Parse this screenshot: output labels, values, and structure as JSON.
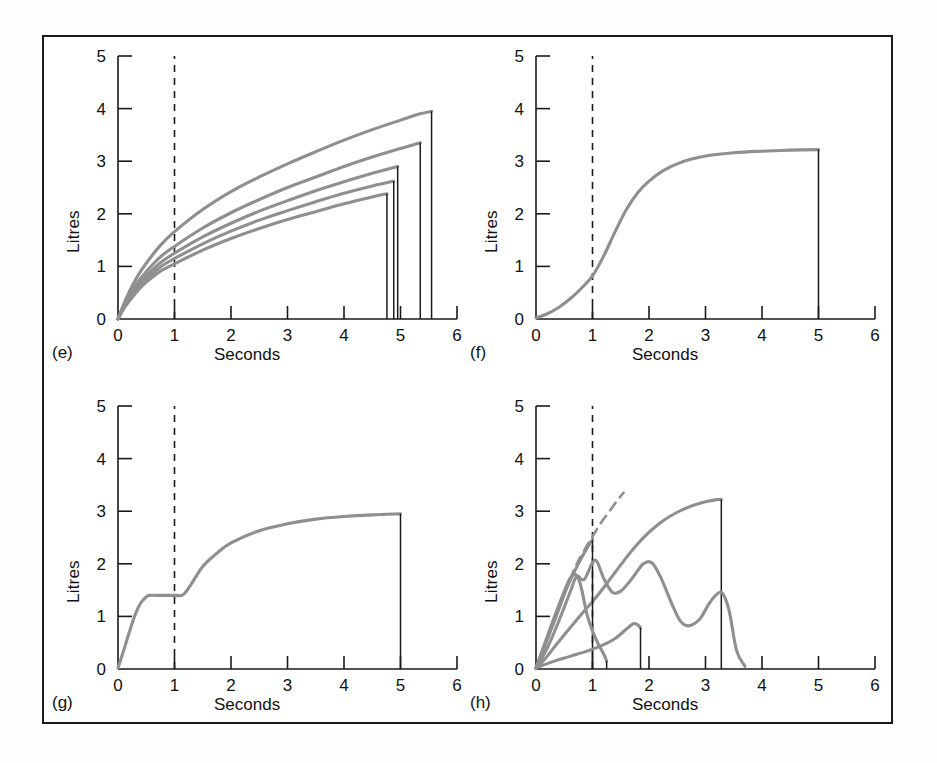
{
  "figure": {
    "background": "#ffffff",
    "border_color": "#1a1a1a",
    "curve_color": "#8f8f8f",
    "axis_color": "#1a1a1a",
    "dashed_color": "#1a1a1a"
  },
  "axes_common": {
    "ylabel": "Litres",
    "xlabel": "Seconds",
    "xticks": [
      0,
      1,
      2,
      3,
      4,
      5,
      6
    ],
    "yticks": [
      0,
      1,
      2,
      3,
      4,
      5
    ],
    "xlim": [
      0,
      6
    ],
    "ylim": [
      0,
      5
    ],
    "grid": false,
    "marker_line_x": 1
  },
  "panels": [
    {
      "id": "e",
      "label": "(e)",
      "ylabel": "Litres",
      "xlabel": "Seconds"
    },
    {
      "id": "f",
      "label": "(f)",
      "ylabel": "Litres",
      "xlabel": "Seconds"
    },
    {
      "id": "g",
      "label": "(g)",
      "ylabel": "Litres",
      "xlabel": "Seconds"
    },
    {
      "id": "h",
      "label": "(h)",
      "ylabel": "Litres",
      "xlabel": "Seconds"
    }
  ],
  "chart_data": [
    {
      "type": "line",
      "panel": "e",
      "title": "(e)",
      "xlabel": "Seconds",
      "ylabel": "Litres",
      "xlim": [
        0,
        6
      ],
      "ylim": [
        0,
        5
      ],
      "xticks": [
        0,
        1,
        2,
        3,
        4,
        5,
        6
      ],
      "yticks": [
        0,
        1,
        2,
        3,
        4,
        5
      ],
      "grid": false,
      "legend": "none",
      "annotations": [
        {
          "type": "vline",
          "x": 1,
          "style": "dashed"
        }
      ],
      "series": [
        {
          "name": "curve-1",
          "x": [
            0,
            0.1,
            0.2,
            0.35,
            0.5,
            0.75,
            1.0,
            1.5,
            2.0,
            2.5,
            3.0,
            3.5,
            4.0,
            4.5,
            5.0,
            5.35,
            5.55
          ],
          "y": [
            0,
            0.28,
            0.52,
            0.82,
            1.06,
            1.4,
            1.66,
            2.08,
            2.42,
            2.7,
            2.95,
            3.18,
            3.4,
            3.6,
            3.78,
            3.9,
            3.95
          ],
          "end_drop_x": 5.55,
          "end_drop_y": 3.95
        },
        {
          "name": "curve-2",
          "x": [
            0,
            0.1,
            0.2,
            0.35,
            0.5,
            0.75,
            1.0,
            1.5,
            2.0,
            2.5,
            3.0,
            3.5,
            4.0,
            4.5,
            5.0,
            5.35
          ],
          "y": [
            0,
            0.24,
            0.44,
            0.7,
            0.9,
            1.18,
            1.38,
            1.73,
            2.02,
            2.27,
            2.5,
            2.7,
            2.9,
            3.08,
            3.24,
            3.35
          ],
          "end_drop_x": 5.35,
          "end_drop_y": 3.35
        },
        {
          "name": "curve-3",
          "x": [
            0,
            0.1,
            0.2,
            0.35,
            0.5,
            0.75,
            1.0,
            1.5,
            2.0,
            2.5,
            3.0,
            3.5,
            4.0,
            4.5,
            4.95
          ],
          "y": [
            0,
            0.22,
            0.4,
            0.64,
            0.82,
            1.07,
            1.25,
            1.56,
            1.82,
            2.05,
            2.25,
            2.44,
            2.61,
            2.77,
            2.9
          ],
          "end_drop_x": 4.95,
          "end_drop_y": 2.9
        },
        {
          "name": "curve-4",
          "x": [
            0,
            0.1,
            0.2,
            0.35,
            0.5,
            0.75,
            1.0,
            1.5,
            2.0,
            2.5,
            3.0,
            3.5,
            4.0,
            4.5,
            4.88
          ],
          "y": [
            0,
            0.2,
            0.37,
            0.59,
            0.76,
            0.99,
            1.15,
            1.43,
            1.67,
            1.88,
            2.06,
            2.23,
            2.39,
            2.53,
            2.62
          ],
          "end_drop_x": 4.88,
          "end_drop_y": 2.62
        },
        {
          "name": "curve-5",
          "x": [
            0,
            0.1,
            0.2,
            0.35,
            0.5,
            0.75,
            1.0,
            1.5,
            2.0,
            2.5,
            3.0,
            3.5,
            4.0,
            4.5,
            4.76
          ],
          "y": [
            0,
            0.19,
            0.34,
            0.54,
            0.7,
            0.91,
            1.05,
            1.31,
            1.53,
            1.72,
            1.89,
            2.04,
            2.19,
            2.32,
            2.38
          ],
          "end_drop_x": 4.76,
          "end_drop_y": 2.38
        }
      ]
    },
    {
      "type": "line",
      "panel": "f",
      "title": "(f)",
      "xlabel": "Seconds",
      "ylabel": "Litres",
      "xlim": [
        0,
        6
      ],
      "ylim": [
        0,
        5
      ],
      "xticks": [
        0,
        1,
        2,
        3,
        4,
        5,
        6
      ],
      "yticks": [
        0,
        1,
        2,
        3,
        4,
        5
      ],
      "grid": false,
      "legend": "none",
      "annotations": [
        {
          "type": "vline",
          "x": 1,
          "style": "dashed"
        }
      ],
      "series": [
        {
          "name": "sigmoid-curve",
          "x": [
            0,
            0.2,
            0.4,
            0.6,
            0.8,
            1.0,
            1.2,
            1.4,
            1.6,
            1.8,
            2.0,
            2.25,
            2.5,
            2.75,
            3.0,
            3.5,
            4.0,
            4.5,
            5.0
          ],
          "y": [
            0.02,
            0.1,
            0.22,
            0.38,
            0.58,
            0.82,
            1.2,
            1.66,
            2.08,
            2.4,
            2.62,
            2.82,
            2.95,
            3.04,
            3.1,
            3.16,
            3.19,
            3.21,
            3.22
          ],
          "end_drop_x": 5.0,
          "end_drop_y": 3.22
        }
      ]
    },
    {
      "type": "line",
      "panel": "g",
      "title": "(g)",
      "xlabel": "Seconds",
      "ylabel": "Litres",
      "xlim": [
        0,
        6
      ],
      "ylim": [
        0,
        5
      ],
      "xticks": [
        0,
        1,
        2,
        3,
        4,
        5,
        6
      ],
      "yticks": [
        0,
        1,
        2,
        3,
        4,
        5
      ],
      "grid": false,
      "legend": "none",
      "annotations": [
        {
          "type": "vline",
          "x": 1,
          "style": "dashed"
        }
      ],
      "series": [
        {
          "name": "step-plateau-curve",
          "x": [
            0,
            0.1,
            0.2,
            0.3,
            0.4,
            0.5,
            0.55,
            0.7,
            1.0,
            1.15,
            1.3,
            1.5,
            1.75,
            2.0,
            2.5,
            3.0,
            3.5,
            4.0,
            4.5,
            5.0
          ],
          "y": [
            0.02,
            0.35,
            0.7,
            1.02,
            1.25,
            1.37,
            1.4,
            1.4,
            1.4,
            1.41,
            1.62,
            1.95,
            2.2,
            2.4,
            2.63,
            2.76,
            2.85,
            2.9,
            2.93,
            2.95
          ],
          "end_drop_x": 5.0,
          "end_drop_y": 2.95
        }
      ]
    },
    {
      "type": "line",
      "panel": "h",
      "title": "(h)",
      "xlabel": "Seconds",
      "ylabel": "Litres",
      "xlim": [
        0,
        6
      ],
      "ylim": [
        0,
        5
      ],
      "xticks": [
        0,
        1,
        2,
        3,
        4,
        5,
        6
      ],
      "yticks": [
        0,
        1,
        2,
        3,
        4,
        5
      ],
      "grid": false,
      "legend": "none",
      "annotations": [
        {
          "type": "vline",
          "x": 1,
          "style": "dashed"
        }
      ],
      "series": [
        {
          "name": "dashed-reference-curve",
          "style": "dashed",
          "x": [
            0,
            0.15,
            0.3,
            0.5,
            0.7,
            0.85,
            1.0,
            1.15,
            1.3,
            1.45,
            1.55
          ],
          "y": [
            0,
            0.42,
            0.85,
            1.42,
            1.95,
            2.25,
            2.52,
            2.78,
            3.0,
            3.22,
            3.35
          ]
        },
        {
          "name": "big-rising-curve",
          "x": [
            0,
            0.15,
            0.35,
            0.6,
            0.85,
            1.0,
            1.25,
            1.5,
            1.75,
            2.0,
            2.25,
            2.5,
            2.75,
            3.0,
            3.2,
            3.28
          ],
          "y": [
            0.02,
            0.18,
            0.45,
            0.78,
            1.1,
            1.28,
            1.62,
            1.98,
            2.32,
            2.6,
            2.82,
            2.98,
            3.1,
            3.18,
            3.22,
            3.22
          ],
          "end_drop_x": 3.28,
          "end_drop_y": 3.22
        },
        {
          "name": "early-peak-curve",
          "x": [
            0,
            0.15,
            0.35,
            0.55,
            0.75,
            0.95,
            1.0
          ],
          "y": [
            0.02,
            0.42,
            0.98,
            1.55,
            2.0,
            2.38,
            2.45
          ],
          "end_drop_x": 1.0,
          "end_drop_y": 2.45
        },
        {
          "name": "double-hump-curve",
          "x": [
            0,
            0.2,
            0.4,
            0.6,
            0.72,
            0.85,
            1.0,
            1.08,
            1.2,
            1.35,
            1.5,
            1.7,
            1.9,
            2.05,
            2.2,
            2.4,
            2.55,
            2.7,
            2.9,
            3.05,
            3.18,
            3.3,
            3.42,
            3.55,
            3.7
          ],
          "y": [
            0.02,
            0.4,
            0.9,
            1.45,
            1.76,
            1.7,
            2.02,
            2.04,
            1.72,
            1.46,
            1.48,
            1.72,
            2.0,
            2.02,
            1.76,
            1.25,
            0.92,
            0.82,
            0.95,
            1.22,
            1.4,
            1.44,
            1.1,
            0.35,
            0.05
          ]
        },
        {
          "name": "sharp-spike-curve",
          "x": [
            0,
            0.2,
            0.4,
            0.6,
            0.72,
            0.8,
            0.9,
            1.0,
            1.1,
            1.2,
            1.25
          ],
          "y": [
            0.02,
            0.62,
            1.2,
            1.72,
            1.78,
            1.55,
            1.05,
            0.72,
            0.48,
            0.28,
            0.15
          ],
          "end_drop_x": 1.25,
          "end_drop_y": 0.15
        },
        {
          "name": "low-bump-curve",
          "x": [
            0,
            0.3,
            0.6,
            0.9,
            1.15,
            1.4,
            1.6,
            1.72,
            1.8,
            1.85
          ],
          "y": [
            0.02,
            0.14,
            0.24,
            0.34,
            0.44,
            0.58,
            0.76,
            0.86,
            0.84,
            0.78
          ],
          "end_drop_x": 1.85,
          "end_drop_y": 0.78
        }
      ]
    }
  ]
}
